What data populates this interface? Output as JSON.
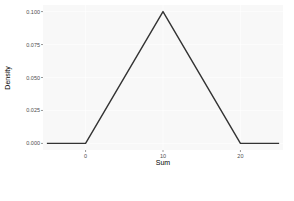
{
  "chart_data": {
    "type": "line",
    "title": "",
    "xlabel": "Sum",
    "ylabel": "Density",
    "x": [
      -5,
      0,
      10,
      20,
      25
    ],
    "series": [
      {
        "name": "density",
        "values": [
          0.0,
          0.0,
          0.1,
          0.0,
          0.0
        ]
      }
    ],
    "xlim": [
      -5.5,
      25.5
    ],
    "ylim": [
      -0.005,
      0.105
    ],
    "xticks": [
      0,
      10,
      20
    ],
    "xtick_labels": [
      "0",
      "10",
      "20"
    ],
    "yticks": [
      0.0,
      0.025,
      0.05,
      0.075,
      0.1
    ],
    "ytick_labels": [
      "0.000",
      "0.025",
      "0.050",
      "0.075",
      "0.100"
    ],
    "grid": true,
    "legend": "none",
    "colors": {
      "line": "#333333",
      "panel_bg": "#ebebeb",
      "grid": "#ffffff"
    }
  }
}
